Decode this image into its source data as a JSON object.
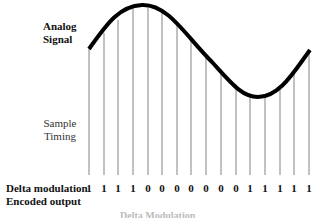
{
  "labels": {
    "analog_line1": "Analog",
    "analog_line2": "Signal",
    "sample_line1": "Sample",
    "sample_line2": "Timing",
    "output_line1": "Delta modulation",
    "output_line2": "Encoded output",
    "caption": "Delta Modulation"
  },
  "signal": {
    "description": "Sinusoidal analog waveform sampled at regular intervals",
    "curve_color": "#000000",
    "sample_line_color": "#a0a0a0",
    "baseline_y": 175
  },
  "samples": [
    {
      "x": 89,
      "y": 49,
      "bit": "1"
    },
    {
      "x": 104,
      "y": 33,
      "bit": "1"
    },
    {
      "x": 118,
      "y": 20,
      "bit": "1"
    },
    {
      "x": 133,
      "y": 9,
      "bit": "1"
    },
    {
      "x": 148,
      "y": 6,
      "bit": "0"
    },
    {
      "x": 162,
      "y": 10,
      "bit": "0"
    },
    {
      "x": 177,
      "y": 22,
      "bit": "0"
    },
    {
      "x": 191,
      "y": 38,
      "bit": "0"
    },
    {
      "x": 206,
      "y": 55,
      "bit": "0"
    },
    {
      "x": 221,
      "y": 70,
      "bit": "0"
    },
    {
      "x": 236,
      "y": 84,
      "bit": "0"
    },
    {
      "x": 250,
      "y": 95,
      "bit": "1"
    },
    {
      "x": 265,
      "y": 95,
      "bit": "1"
    },
    {
      "x": 280,
      "y": 86,
      "bit": "1"
    },
    {
      "x": 294,
      "y": 72,
      "bit": "1"
    },
    {
      "x": 309,
      "y": 52,
      "bit": "1"
    }
  ],
  "encoded_bits": "1111000000011111"
}
